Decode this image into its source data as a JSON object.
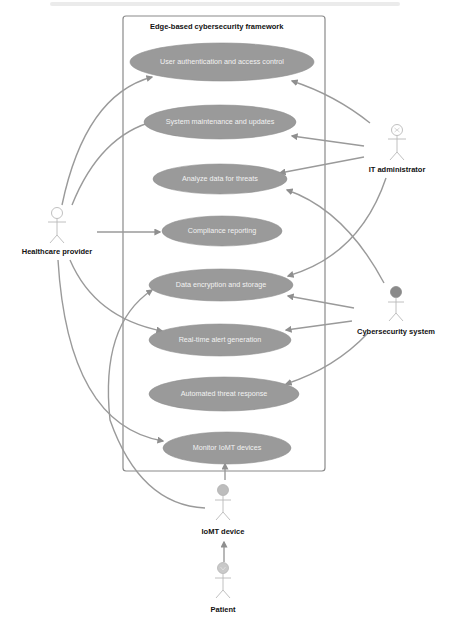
{
  "diagram": {
    "type": "uml-use-case",
    "boundary": {
      "title": "Edge-based cybersecurity framework"
    },
    "use_cases": [
      {
        "id": "uc1",
        "label": "User authentication and access control"
      },
      {
        "id": "uc2",
        "label": "System maintenance and updates"
      },
      {
        "id": "uc3",
        "label": "Analyze data for threats"
      },
      {
        "id": "uc4",
        "label": "Compliance reporting"
      },
      {
        "id": "uc5",
        "label": "Data encryption and storage"
      },
      {
        "id": "uc6",
        "label": "Real-time alert generation"
      },
      {
        "id": "uc7",
        "label": "Automated threat response"
      },
      {
        "id": "uc8",
        "label": "Monitor IoMT devices"
      }
    ],
    "actors": [
      {
        "id": "a1",
        "label": "Healthcare provider",
        "head_style": "outline"
      },
      {
        "id": "a2",
        "label": "IT administrator",
        "head_style": "outline-with-symbol"
      },
      {
        "id": "a3",
        "label": "Cybersecurity system",
        "head_style": "filled-dark"
      },
      {
        "id": "a4",
        "label": "IoMT device",
        "head_style": "filled-light"
      },
      {
        "id": "a5",
        "label": "Patient",
        "head_style": "filled-light-with-symbol"
      }
    ],
    "associations": [
      {
        "from": "Healthcare provider",
        "to": "User authentication and access control"
      },
      {
        "from": "Healthcare provider",
        "to": "System maintenance and updates"
      },
      {
        "from": "Healthcare provider",
        "to": "Compliance reporting"
      },
      {
        "from": "Healthcare provider",
        "to": "Real-time alert generation"
      },
      {
        "from": "Healthcare provider",
        "to": "Monitor IoMT devices"
      },
      {
        "from": "IT administrator",
        "to": "User authentication and access control"
      },
      {
        "from": "IT administrator",
        "to": "System maintenance and updates"
      },
      {
        "from": "IT administrator",
        "to": "Analyze data for threats"
      },
      {
        "from": "IT administrator",
        "to": "Data encryption and storage"
      },
      {
        "from": "Cybersecurity system",
        "to": "Analyze data for threats"
      },
      {
        "from": "Cybersecurity system",
        "to": "Data encryption and storage"
      },
      {
        "from": "Cybersecurity system",
        "to": "Real-time alert generation"
      },
      {
        "from": "Cybersecurity system",
        "to": "Automated threat response"
      },
      {
        "from": "IoMT device",
        "to": "Monitor IoMT devices"
      },
      {
        "from": "IoMT device",
        "to": "Data encryption and storage"
      },
      {
        "from": "Patient",
        "to": "IoMT device"
      }
    ],
    "colors": {
      "use_case_fill": "#9a9a9a",
      "use_case_text": "#f2f2f2",
      "line": "#9a9a9a",
      "boundary": "#8a8a8a",
      "actor_outline": "#b9b9b9",
      "cyber_head": "#8a8a8a",
      "iomt_head": "#bdbdbd"
    }
  }
}
